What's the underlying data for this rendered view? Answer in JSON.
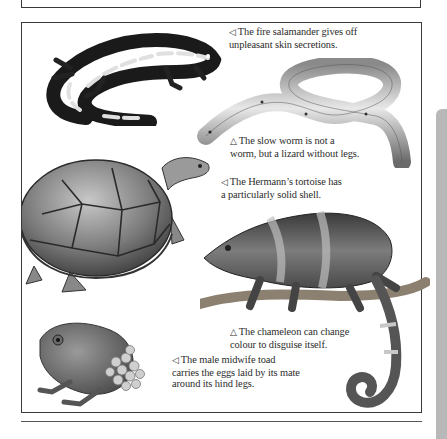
{
  "page": {
    "background": "#ffffff",
    "border_color": "#3a3a3a",
    "side_tab_color": "#b8b8b8"
  },
  "captions": {
    "salamander": {
      "marker": "◁",
      "lines": [
        "The fire salamander gives off",
        "unpleasant skin secretions."
      ]
    },
    "slow_worm": {
      "marker": "△",
      "lines": [
        "The slow worm is not a",
        "worm, but a lizard without legs."
      ]
    },
    "tortoise": {
      "marker": "◁",
      "lines": [
        "The Hermann’s tortoise has",
        "a particularly solid shell."
      ]
    },
    "chameleon": {
      "marker": "△",
      "lines": [
        "The chameleon can change",
        "colour to disguise itself."
      ]
    },
    "toad": {
      "marker": "◁",
      "lines": [
        "The male midwife toad",
        "carries the eggs laid by its mate",
        "around its hind legs."
      ]
    }
  },
  "illustrations": [
    {
      "name": "fire-salamander-illustration"
    },
    {
      "name": "slow-worm-illustration"
    },
    {
      "name": "hermanns-tortoise-illustration"
    },
    {
      "name": "chameleon-illustration"
    },
    {
      "name": "midwife-toad-illustration"
    }
  ]
}
